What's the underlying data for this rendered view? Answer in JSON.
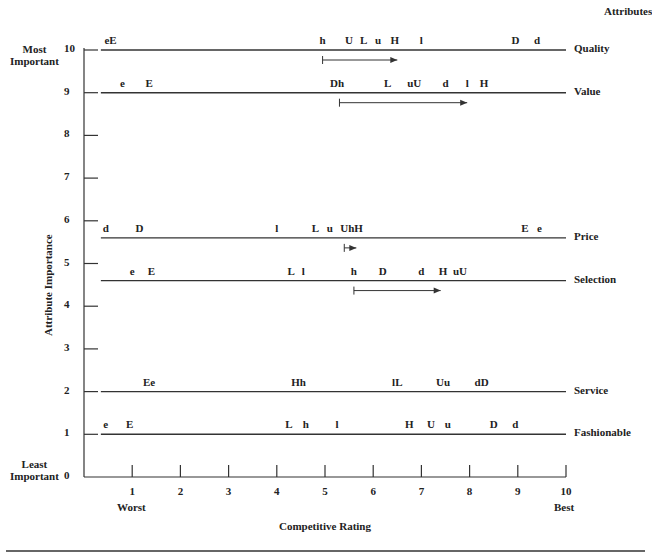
{
  "chart_data": {
    "type": "scatter",
    "title": "",
    "xlabel": "Competitive Rating",
    "ylabel": "Attribute Importance",
    "xlim": [
      0,
      10
    ],
    "ylim": [
      0,
      10
    ],
    "x_ticks": [
      "1",
      "2",
      "3",
      "4",
      "5",
      "6",
      "7",
      "8",
      "9",
      "10"
    ],
    "y_ticks": [
      "0",
      "1",
      "2",
      "3",
      "4",
      "5",
      "6",
      "7",
      "8",
      "9",
      "10"
    ],
    "x_end_labels": {
      "left": "Worst",
      "right": "Best"
    },
    "y_end_labels": {
      "top": "Most Important",
      "bottom": "Least Important"
    },
    "legend_header": "Attributes",
    "grid": false,
    "attributes": [
      {
        "name": "Quality",
        "importance": 10,
        "markers": [
          {
            "label": "eE",
            "x": 0.55
          },
          {
            "label": "h",
            "x": 4.95
          },
          {
            "label": "U",
            "x": 5.5
          },
          {
            "label": "L",
            "x": 5.8
          },
          {
            "label": "u",
            "x": 6.1
          },
          {
            "label": "H",
            "x": 6.45
          },
          {
            "label": "l",
            "x": 7.0
          },
          {
            "label": "D",
            "x": 8.95
          },
          {
            "label": "d",
            "x": 9.4
          }
        ],
        "arrow": {
          "from": 4.95,
          "to": 6.5
        }
      },
      {
        "name": "Value",
        "importance": 9,
        "markers": [
          {
            "label": "e",
            "x": 0.8
          },
          {
            "label": "E",
            "x": 1.35
          },
          {
            "label": "Dh",
            "x": 5.25
          },
          {
            "label": "L",
            "x": 6.3
          },
          {
            "label": "uU",
            "x": 6.85
          },
          {
            "label": "d",
            "x": 7.5
          },
          {
            "label": "l",
            "x": 7.95
          },
          {
            "label": "H",
            "x": 8.3
          }
        ],
        "arrow": {
          "from": 5.3,
          "to": 7.95
        }
      },
      {
        "name": "Price",
        "importance": 5.6,
        "markers": [
          {
            "label": "d",
            "x": 0.45
          },
          {
            "label": "D",
            "x": 1.15
          },
          {
            "label": "l",
            "x": 4.0
          },
          {
            "label": "L",
            "x": 4.8
          },
          {
            "label": "u",
            "x": 5.1
          },
          {
            "label": "UhH",
            "x": 5.55
          },
          {
            "label": "E",
            "x": 9.15
          },
          {
            "label": "e",
            "x": 9.45
          }
        ],
        "arrow": {
          "from": 5.4,
          "to": 5.65
        }
      },
      {
        "name": "Selection",
        "importance": 4.6,
        "markers": [
          {
            "label": "e",
            "x": 1.0
          },
          {
            "label": "E",
            "x": 1.4
          },
          {
            "label": "L",
            "x": 4.3
          },
          {
            "label": "l",
            "x": 4.55
          },
          {
            "label": "h",
            "x": 5.6
          },
          {
            "label": "D",
            "x": 6.2
          },
          {
            "label": "d",
            "x": 7.0
          },
          {
            "label": "H",
            "x": 7.45
          },
          {
            "label": "uU",
            "x": 7.8
          }
        ],
        "arrow": {
          "from": 5.6,
          "to": 7.4
        }
      },
      {
        "name": "Service",
        "importance": 2,
        "markers": [
          {
            "label": "Ee",
            "x": 1.35
          },
          {
            "label": "Hh",
            "x": 4.45
          },
          {
            "label": "lL",
            "x": 6.5
          },
          {
            "label": "Uu",
            "x": 7.45
          },
          {
            "label": "dD",
            "x": 8.25
          }
        ],
        "arrow": null
      },
      {
        "name": "Fashionable",
        "importance": 1,
        "markers": [
          {
            "label": "e",
            "x": 0.45
          },
          {
            "label": "E",
            "x": 0.95
          },
          {
            "label": "L",
            "x": 4.25
          },
          {
            "label": "h",
            "x": 4.6
          },
          {
            "label": "l",
            "x": 5.25
          },
          {
            "label": "H",
            "x": 6.75
          },
          {
            "label": "U",
            "x": 7.2
          },
          {
            "label": "u",
            "x": 7.55
          },
          {
            "label": "D",
            "x": 8.5
          },
          {
            "label": "d",
            "x": 8.95
          }
        ],
        "arrow": null
      }
    ]
  }
}
